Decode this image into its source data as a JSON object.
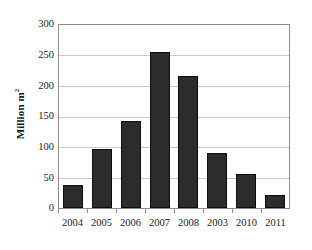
{
  "chart_data": {
    "type": "bar",
    "title": "",
    "subtitle": "",
    "xlabel": "",
    "ylabel": "Million m",
    "ylabel_superscript": "2",
    "categories": [
      "2004",
      "2005",
      "2006",
      "2007",
      "2008",
      "2003",
      "2010",
      "2011"
    ],
    "values": [
      38,
      97,
      142,
      255,
      216,
      90,
      55,
      22
    ],
    "series": [
      {
        "name": "Area",
        "values": [
          38,
          97,
          142,
          255,
          216,
          90,
          55,
          22
        ]
      }
    ],
    "ylim": [
      0,
      300
    ],
    "y_ticks": [
      0,
      50,
      100,
      150,
      200,
      250,
      300
    ],
    "y_tick_labels": [
      "0",
      "50",
      "100",
      "150",
      "200",
      "250",
      "300"
    ],
    "grid": true,
    "grid_axis": "y",
    "legend": false,
    "legend_position": "none",
    "annotations": [],
    "colors": {
      "bar_fill": "#2c2c2c",
      "bar_stroke": "#0d0d0d",
      "gridline": "#c9c9c9",
      "axis_border": "#8d8d8d",
      "text": "#1a1a1a",
      "background": "#ffffff"
    }
  }
}
